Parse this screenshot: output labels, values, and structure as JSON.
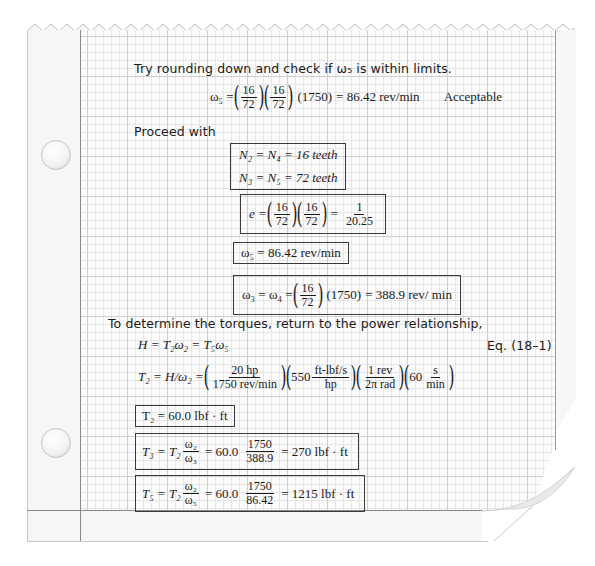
{
  "page": {
    "style": "graph-paper notebook page with torn zigzag top and curled bottom-right corner",
    "colors": {
      "paper": "#f6f6f6",
      "grid_minor": "#e6e6e6",
      "grid_major": "#cfcfcf",
      "margin_line": "#8a8a8a",
      "ink": "#1a1a1a",
      "box_border": "#3a3a3a"
    }
  },
  "text": {
    "try_rounding": "Try rounding down and check if ω₅ is within limits.",
    "proceed_with": "Proceed with",
    "determine_torques": "To determine the torques, return to the power relationship,",
    "eq_ref": "Eq. (18–1)",
    "acceptable": "Acceptable"
  },
  "equations": {
    "omega5_check": {
      "lhs": "ω₅ =",
      "f1_num": "16",
      "f1_den": "72",
      "f2_num": "16",
      "f2_den": "72",
      "input": "(1750)",
      "result": "= 86.42 rev/min"
    },
    "n2_n4": "N₂ = N₄ = 16 teeth",
    "n3_n5": "N₃ = N₅ = 72 teeth",
    "train_value": {
      "lhs": "e =",
      "f1_num": "16",
      "f1_den": "72",
      "f2_num": "16",
      "f2_den": "72",
      "eq": "=",
      "r_num": "1",
      "r_den": "20.25"
    },
    "omega5_final": "ω₅ = 86.42 rev/min",
    "omega3_4": {
      "lhs": "ω₃ = ω₄ =",
      "f_num": "16",
      "f_den": "72",
      "input": "(1750)",
      "result": "= 388.9 rev/ min"
    },
    "power": "H = T₂ω₂ = T₅ω₅",
    "t2_calc": {
      "lhs": "T₂ = H/ω₂ =",
      "a_num": "20 hp",
      "a_den": "1750 rev/min",
      "b_coef": "550",
      "b_num": "ft-lbf/s",
      "b_den": "hp",
      "c_num": "1 rev",
      "c_den": "2π rad",
      "d_coef": "60",
      "d_num": "s",
      "d_den": "min"
    },
    "t2_result": "T₂ = 60.0 lbf · ft",
    "t3": {
      "lhs": "T₃ = T₂",
      "ratio_num": "ω₂",
      "ratio_den": "ω₃",
      "mid": "= 60.0",
      "v_num": "1750",
      "v_den": "388.9",
      "result": "= 270 lbf · ft"
    },
    "t5": {
      "lhs": "T₅ = T₂",
      "ratio_num": "ω₂",
      "ratio_den": "ω₅",
      "mid": "= 60.0",
      "v_num": "1750",
      "v_den": "86.42",
      "result": "= 1215 lbf · ft"
    }
  }
}
